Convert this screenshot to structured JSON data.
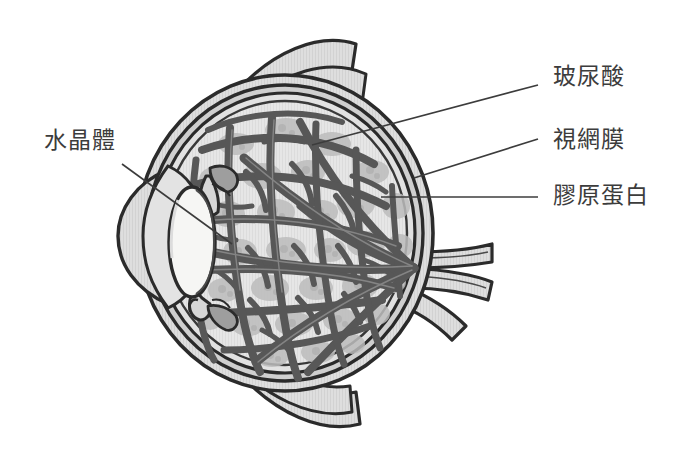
{
  "diagram": {
    "background_color": "#ffffff",
    "line_color": "#2b2b2b",
    "text_color": "#3c3c3c",
    "fiber_color": "#5a5a5a",
    "vitreous_cell_color": "#b9b9b9",
    "vitreous_base_color": "#e4e4e4",
    "sclera_color": "#dcdcdc",
    "lens_color": "#f4f4f2",
    "muscle_color": "#d2d2d2"
  },
  "labels": [
    {
      "id": "lens",
      "text": "水晶體",
      "side": "left",
      "x": 44,
      "y": 129,
      "leader": {
        "x1": 122,
        "y1": 164,
        "x2": 232,
        "y2": 244
      }
    },
    {
      "id": "hyaluronic-acid",
      "text": "玻尿酸",
      "side": "right",
      "x": 553,
      "y": 65,
      "leader": {
        "x1": 538,
        "y1": 85,
        "x2": 312,
        "y2": 145
      }
    },
    {
      "id": "retina",
      "text": "視網膜",
      "side": "right",
      "x": 553,
      "y": 128,
      "leader": {
        "x1": 538,
        "y1": 139,
        "x2": 414,
        "y2": 178
      }
    },
    {
      "id": "collagen",
      "text": "膠原蛋白",
      "side": "right",
      "x": 553,
      "y": 184,
      "leader": {
        "x1": 538,
        "y1": 197,
        "x2": 381,
        "y2": 197
      }
    }
  ],
  "structures": [
    {
      "name": "cornea",
      "label_zh": "角膜",
      "annotated": false
    },
    {
      "name": "anterior-chamber",
      "label_zh": "前房",
      "annotated": false
    },
    {
      "name": "lens",
      "label_zh": "水晶體",
      "annotated": true
    },
    {
      "name": "iris",
      "label_zh": "虹膜",
      "annotated": false
    },
    {
      "name": "ciliary-body",
      "label_zh": "睫狀體",
      "annotated": false
    },
    {
      "name": "vitreous-humour",
      "label_zh": "玻尿酸",
      "annotated": true
    },
    {
      "name": "collagen-fibres",
      "label_zh": "膠原蛋白",
      "annotated": true
    },
    {
      "name": "retina",
      "label_zh": "視網膜",
      "annotated": true
    },
    {
      "name": "sclera",
      "label_zh": "鞏膜",
      "annotated": false
    },
    {
      "name": "optic-nerve",
      "label_zh": "視神經",
      "annotated": false
    },
    {
      "name": "extraocular-muscle-superior",
      "label_zh": "上眼外肌",
      "annotated": false
    },
    {
      "name": "extraocular-muscle-inferior",
      "label_zh": "下眼外肌",
      "annotated": false
    }
  ],
  "geometry": {
    "globe": {
      "cx": 285,
      "cy": 233,
      "rx": 148,
      "ry": 158
    },
    "lens": {
      "cx": 192,
      "cy": 242,
      "rx": 22,
      "ry": 54
    },
    "optic_nerve": {
      "x_start": 425,
      "x_end": 492,
      "y": 280
    }
  }
}
